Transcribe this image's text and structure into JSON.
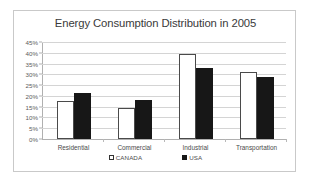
{
  "chart_data": {
    "type": "bar",
    "title": "Energy Consumption Distribution in 2005",
    "xlabel": "",
    "ylabel": "",
    "categories": [
      "Residential",
      "Commercial",
      "Industrial",
      "Transportation"
    ],
    "series": [
      {
        "name": "CANADA",
        "color": "#ffffff",
        "values": [
          17.5,
          14.5,
          39.5,
          31.0
        ]
      },
      {
        "name": "USA",
        "color": "#171717",
        "values": [
          21.5,
          18.0,
          33.0,
          29.0
        ]
      }
    ],
    "ylim": [
      0,
      45
    ],
    "ytick_labels": [
      "0%",
      "5%",
      "10%",
      "15%",
      "20%",
      "25%",
      "30%",
      "35%",
      "40%",
      "45%"
    ],
    "ytick_values": [
      0,
      5,
      10,
      15,
      20,
      25,
      30,
      35,
      40,
      45
    ],
    "grid": true,
    "legend_position": "bottom",
    "value_suffix": "%"
  },
  "legend": {
    "entries": [
      {
        "label": "CANADA",
        "swatch": "white-square-marker"
      },
      {
        "label": "USA",
        "swatch": "black-square-marker"
      }
    ]
  },
  "colors": {
    "border": "#c9c9c9",
    "gridline": "#d4d4d4",
    "axis": "#b0b0b0",
    "title_text": "#3a3a3a",
    "tick_text": "#5c5c5c",
    "canada_bar": "#ffffff",
    "usa_bar": "#171717",
    "background": "#ffffff"
  }
}
